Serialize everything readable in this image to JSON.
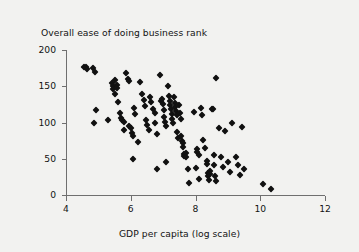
{
  "figure": {
    "background_color": "#f2f2f0",
    "axis_color": "#6f6f6f",
    "marker_color": "#111111"
  },
  "chart_data": {
    "type": "scatter",
    "title": "Overall ease of doing business rank",
    "xlabel": "GDP per capita (log scale)",
    "ylabel": "",
    "xlim": [
      4,
      12
    ],
    "ylim": [
      0,
      200
    ],
    "xticks": [
      4,
      6,
      8,
      10,
      12
    ],
    "yticks": [
      0,
      50,
      100,
      150,
      200
    ],
    "grid": false,
    "legend": null,
    "marker_shape": "diamond",
    "points": [
      [
        4.56,
        177
      ],
      [
        4.62,
        176
      ],
      [
        4.66,
        174
      ],
      [
        4.82,
        175
      ],
      [
        4.9,
        170
      ],
      [
        4.93,
        117
      ],
      [
        4.86,
        99
      ],
      [
        5.3,
        103
      ],
      [
        5.42,
        155
      ],
      [
        5.44,
        151
      ],
      [
        5.46,
        146
      ],
      [
        5.5,
        158
      ],
      [
        5.52,
        140
      ],
      [
        5.56,
        152
      ],
      [
        5.58,
        148
      ],
      [
        5.62,
        128
      ],
      [
        5.66,
        113
      ],
      [
        5.7,
        106
      ],
      [
        5.74,
        104
      ],
      [
        5.78,
        101
      ],
      [
        5.8,
        90
      ],
      [
        5.86,
        168
      ],
      [
        5.9,
        160
      ],
      [
        5.94,
        157
      ],
      [
        5.96,
        95
      ],
      [
        6.0,
        93
      ],
      [
        6.04,
        86
      ],
      [
        6.06,
        82
      ],
      [
        6.1,
        120
      ],
      [
        6.12,
        112
      ],
      [
        6.08,
        49
      ],
      [
        6.22,
        73
      ],
      [
        6.3,
        156
      ],
      [
        6.34,
        140
      ],
      [
        6.4,
        131
      ],
      [
        6.44,
        123
      ],
      [
        6.48,
        104
      ],
      [
        6.5,
        96
      ],
      [
        6.56,
        90
      ],
      [
        6.6,
        135
      ],
      [
        6.64,
        128
      ],
      [
        6.7,
        119
      ],
      [
        6.74,
        113
      ],
      [
        6.76,
        99
      ],
      [
        6.8,
        84
      ],
      [
        6.82,
        36
      ],
      [
        6.9,
        166
      ],
      [
        6.94,
        129
      ],
      [
        6.98,
        132
      ],
      [
        7.0,
        125
      ],
      [
        7.02,
        117
      ],
      [
        7.04,
        108
      ],
      [
        7.06,
        101
      ],
      [
        7.08,
        95
      ],
      [
        7.1,
        46
      ],
      [
        7.14,
        151
      ],
      [
        7.18,
        136
      ],
      [
        7.2,
        130
      ],
      [
        7.22,
        124
      ],
      [
        7.24,
        118
      ],
      [
        7.26,
        112
      ],
      [
        7.28,
        105
      ],
      [
        7.3,
        99
      ],
      [
        7.34,
        135
      ],
      [
        7.36,
        127
      ],
      [
        7.38,
        121
      ],
      [
        7.4,
        116
      ],
      [
        7.42,
        110
      ],
      [
        7.44,
        87
      ],
      [
        7.46,
        78
      ],
      [
        7.5,
        124
      ],
      [
        7.52,
        113
      ],
      [
        7.54,
        105
      ],
      [
        7.56,
        82
      ],
      [
        7.58,
        75
      ],
      [
        7.6,
        72
      ],
      [
        7.62,
        66
      ],
      [
        7.64,
        56
      ],
      [
        7.66,
        54
      ],
      [
        7.7,
        58
      ],
      [
        7.72,
        52
      ],
      [
        7.78,
        36
      ],
      [
        7.8,
        17
      ],
      [
        7.96,
        114
      ],
      [
        8.0,
        37
      ],
      [
        8.04,
        63
      ],
      [
        8.06,
        60
      ],
      [
        8.1,
        55
      ],
      [
        8.12,
        22
      ],
      [
        8.16,
        120
      ],
      [
        8.2,
        111
      ],
      [
        8.24,
        76
      ],
      [
        8.3,
        65
      ],
      [
        8.34,
        47
      ],
      [
        8.36,
        43
      ],
      [
        8.38,
        30
      ],
      [
        8.4,
        26
      ],
      [
        8.42,
        21
      ],
      [
        8.44,
        33
      ],
      [
        8.46,
        29
      ],
      [
        8.5,
        119
      ],
      [
        8.54,
        118
      ],
      [
        8.56,
        55
      ],
      [
        8.58,
        41
      ],
      [
        8.6,
        26
      ],
      [
        8.62,
        19
      ],
      [
        8.64,
        161
      ],
      [
        8.72,
        93
      ],
      [
        8.8,
        53
      ],
      [
        8.86,
        39
      ],
      [
        8.9,
        88
      ],
      [
        9.0,
        45
      ],
      [
        9.06,
        32
      ],
      [
        9.12,
        100
      ],
      [
        9.26,
        52
      ],
      [
        9.3,
        41
      ],
      [
        9.38,
        27
      ],
      [
        9.44,
        94
      ],
      [
        9.5,
        36
      ],
      [
        10.1,
        15
      ],
      [
        10.32,
        8
      ]
    ]
  }
}
